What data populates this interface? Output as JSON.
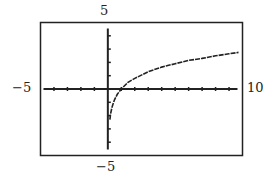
{
  "chart_data": {
    "type": "line",
    "title": "",
    "xlabel": "",
    "ylabel": "",
    "xlim": [
      -5,
      10
    ],
    "ylim": [
      -5,
      5
    ],
    "tick_labels": {
      "xmin": "−5",
      "xmax": "10",
      "ymin": "−5",
      "ymax": "5"
    },
    "grid": false,
    "x_tick_step": 1,
    "y_tick_step": 1,
    "series": [
      {
        "name": "curve",
        "x": [
          0.15,
          0.2,
          0.3,
          0.4,
          0.5,
          0.7,
          1.0,
          1.5,
          2,
          3,
          4,
          5,
          6,
          7,
          8,
          9,
          9.7
        ],
        "y": [
          -2.3,
          -1.9,
          -1.4,
          -1.1,
          -0.8,
          -0.4,
          0.0,
          0.5,
          0.8,
          1.3,
          1.65,
          1.9,
          2.15,
          2.3,
          2.5,
          2.65,
          2.75
        ]
      }
    ]
  }
}
